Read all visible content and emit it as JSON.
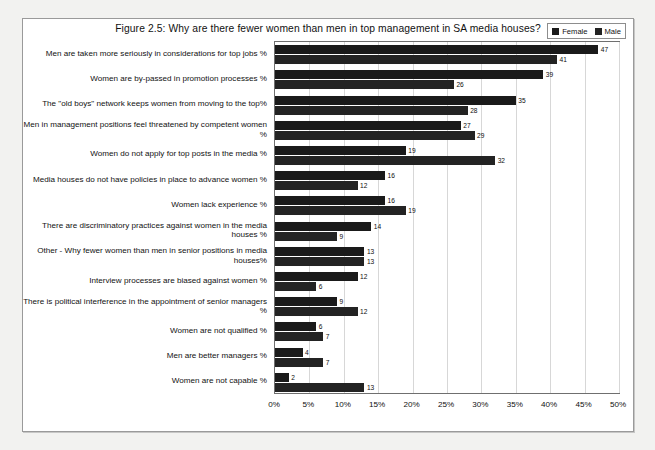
{
  "figure": {
    "title": "Figure 2.5: Why are there fewer women than men in top management in SA media houses?",
    "frame_color": "#9a9a9a",
    "page_background": "#f2f2f0"
  },
  "legend": {
    "position": "top-right",
    "entries": [
      {
        "label": "Female",
        "color": "#1a1a1a"
      },
      {
        "label": "Male",
        "color": "#232323"
      }
    ]
  },
  "chart_data": {
    "type": "bar",
    "orientation": "horizontal",
    "title": "Figure 2.5: Why are there fewer women than men in top management in SA media houses?",
    "xlabel": "",
    "ylabel": "",
    "xlim": [
      0,
      50
    ],
    "grid": true,
    "legend_position": "top-right",
    "xticks": [
      0,
      5,
      10,
      15,
      20,
      25,
      30,
      35,
      40,
      45,
      50
    ],
    "xticklabels": [
      "0%",
      "5%",
      "10%",
      "15%",
      "20%",
      "25%",
      "30%",
      "35%",
      "40%",
      "45%",
      "50%"
    ],
    "categories": [
      "Men are taken more seriously in considerations for top jobs %",
      "Women are by-passed in promotion processes %",
      "The \"old boys\" network keeps women from moving to the top%",
      "Men in management positions feel threatened by competent women %",
      "Women do not apply for top posts in the media %",
      "Media houses do not have policies in place to advance women %",
      "Women lack experience %",
      "There are discriminatory practices against women in the media houses %",
      "Other - Why fewer women than men in senior positions in media houses%",
      "Interview processes are biased against women %",
      "There is political interference in the appointment of senior managers %",
      "Women are not qualified %",
      "Men are better managers %",
      "Women are not capable %"
    ],
    "series": [
      {
        "name": "Female",
        "color": "#1a1a1a",
        "values": [
          47,
          39,
          35,
          27,
          19,
          16,
          16,
          14,
          13,
          12,
          9,
          6,
          4,
          2
        ]
      },
      {
        "name": "Male",
        "color": "#232323",
        "values": [
          41,
          26,
          28,
          29,
          32,
          12,
          19,
          9,
          13,
          6,
          12,
          7,
          7,
          13
        ]
      }
    ]
  }
}
